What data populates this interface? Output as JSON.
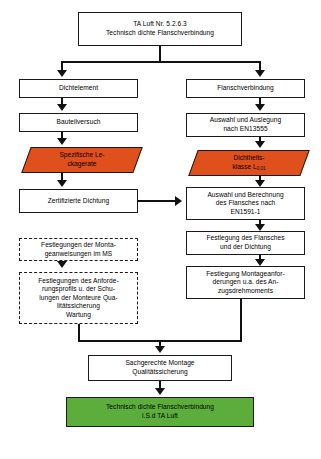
{
  "diagram": {
    "title_node": "TA Luft Nr. 5.2.6.3\nTechnisch dichte Flanschverbindung",
    "left_branch": {
      "n1": "Dichtelement",
      "n2": "Bauteilversuch",
      "n3": "Spezifische Le-\nckagerate",
      "n4": "Zertifizierte Dichtung",
      "n5": "Festlegungen der Monta-\ngeanweisungen im MS",
      "n6": "Festlegungen des Anforde-\nrungsprofils u. der Schu-\nlungen der Monteure Qua-\nlitätssicherung\nWartung"
    },
    "right_branch": {
      "n1": "Flanschverbindung",
      "n2": "Auswahl und Auslegung\nnach EN13555",
      "n3_line1": "Dichtheits-",
      "n3_line2": "klasse L",
      "n3_sub": "0.01",
      "n4": "Auswahl und Berechnung\ndes Flansches nach\nEN1591-1",
      "n5": "Festlegung des Flansches\nund der Dichtung",
      "n6": "Festlegung Montageanfor-\nderungen u.a. des An-\nzugsdrehmoments"
    },
    "bottom": {
      "n1": "Sachgerechte Montage\nQualitätssicherung",
      "n2": "Technisch dichte Flanschverbindung\ni.S.d TA Luft"
    },
    "colors": {
      "leak_class_fill": "#e0501d",
      "result_fill": "#5cad3c",
      "stroke": "#1a1a1a",
      "background": "#ffffff"
    }
  }
}
